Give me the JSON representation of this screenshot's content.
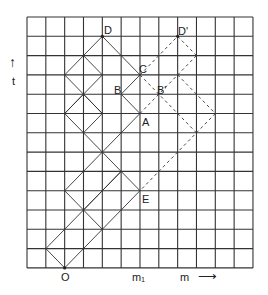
{
  "grid": {
    "x0": 27,
    "y0": 17,
    "cols": 12,
    "rows": 13,
    "dx": 18.83,
    "dy": 19.3
  },
  "axes": {
    "t_label": "t",
    "t_arrow": "↑",
    "m_label": "m",
    "m_arrow": "⟶",
    "m1_label": "m₁"
  },
  "points": {
    "O": {
      "label": "O",
      "c": 2,
      "r": 13
    },
    "D": {
      "label": "D",
      "c": 4,
      "r": 1
    },
    "C": {
      "label": "C",
      "c": 6,
      "r": 3
    },
    "B": {
      "label": "B",
      "c": 5,
      "r": 4
    },
    "A": {
      "label": "A",
      "c": 6,
      "r": 5
    },
    "E": {
      "label": "E",
      "c": 6,
      "r": 9
    },
    "Bp": {
      "label": "B'",
      "c": 7,
      "r": 4
    },
    "Dp": {
      "label": "D'",
      "c": 8,
      "r": 1
    }
  },
  "solid_lines": [
    [
      [
        2,
        13
      ],
      [
        1,
        12
      ]
    ],
    [
      [
        1,
        12
      ],
      [
        5,
        8
      ]
    ],
    [
      [
        2,
        13
      ],
      [
        6,
        9
      ]
    ],
    [
      [
        2,
        9
      ],
      [
        4,
        11
      ]
    ],
    [
      [
        2,
        9
      ],
      [
        6,
        5
      ]
    ],
    [
      [
        4,
        7
      ],
      [
        6,
        9
      ]
    ],
    [
      [
        5,
        8
      ],
      [
        3,
        10
      ]
    ],
    [
      [
        2,
        5
      ],
      [
        4,
        7
      ]
    ],
    [
      [
        2,
        5
      ],
      [
        3,
        4
      ]
    ],
    [
      [
        3,
        4
      ],
      [
        4,
        5
      ]
    ],
    [
      [
        4,
        5
      ],
      [
        3,
        6
      ]
    ],
    [
      [
        2,
        3
      ],
      [
        4,
        5
      ]
    ],
    [
      [
        4,
        3
      ],
      [
        2,
        5
      ]
    ],
    [
      [
        3,
        2
      ],
      [
        4,
        3
      ]
    ],
    [
      [
        2,
        3
      ],
      [
        4,
        1
      ]
    ],
    [
      [
        4,
        1
      ],
      [
        6,
        3
      ]
    ],
    [
      [
        6,
        3
      ],
      [
        5,
        4
      ]
    ],
    [
      [
        5,
        4
      ],
      [
        6,
        5
      ]
    ],
    [
      [
        4,
        5
      ],
      [
        4,
        5
      ]
    ]
  ],
  "dashed_lines": [
    [
      [
        6,
        3
      ],
      [
        8,
        1
      ]
    ],
    [
      [
        8,
        1
      ],
      [
        9,
        2
      ]
    ],
    [
      [
        9,
        2
      ],
      [
        6,
        5
      ]
    ],
    [
      [
        6,
        3
      ],
      [
        9,
        6
      ]
    ],
    [
      [
        8,
        3
      ],
      [
        10,
        5
      ]
    ],
    [
      [
        10,
        5
      ],
      [
        6,
        9
      ]
    ]
  ],
  "colors": {
    "grid": "#333333",
    "line": "#333333"
  }
}
